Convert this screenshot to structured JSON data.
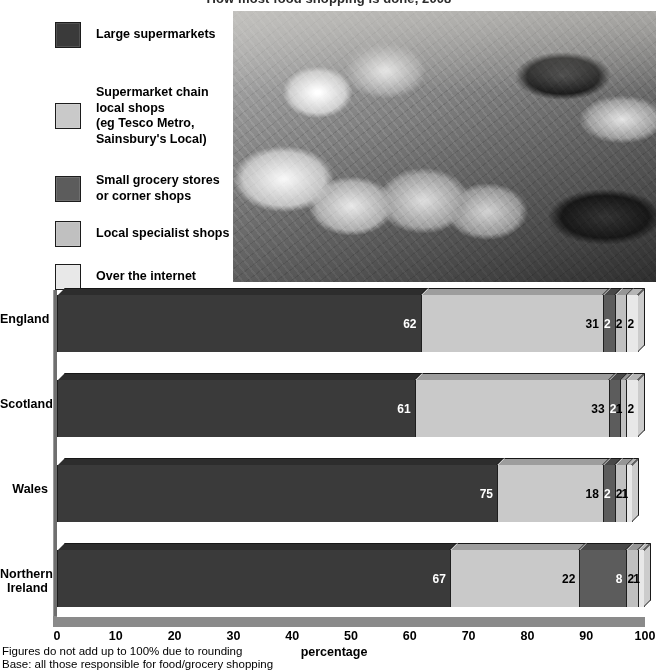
{
  "chart_title": "How most food shopping is done, 2008",
  "legend": {
    "items": [
      {
        "label": "Large supermarkets",
        "color": "#3a3a3a",
        "top": 12
      },
      {
        "label": "Supermarket chain\nlocal shops\n(eg Tesco Metro,\nSainsbury's Local)",
        "color": "#c9c9c9",
        "top": 75
      },
      {
        "label": "Small grocery stores\nor corner shops",
        "color": "#5c5c5c",
        "top": 163
      },
      {
        "label": "Local specialist shops",
        "color": "#c0c0c0",
        "top": 211
      },
      {
        "label": "Over the internet",
        "color": "#e8e8e8",
        "top": 254
      }
    ]
  },
  "photo": {
    "alt": "Packaged fruit and vegetables in plastic wrapping on a supermarket shelf"
  },
  "chart_data": {
    "type": "bar",
    "orientation": "horizontal",
    "stacked": true,
    "title": "How most food shopping is done, 2008",
    "xlabel": "percentage",
    "ylabel": "",
    "xlim": [
      0,
      100
    ],
    "grid": false,
    "legend_position": "top-left",
    "categories": [
      "England",
      "Scotland",
      "Wales",
      "Northern\nIreland"
    ],
    "xticks": [
      0,
      10,
      20,
      30,
      40,
      50,
      60,
      70,
      80,
      90,
      100
    ],
    "series": [
      {
        "name": "Large supermarkets",
        "color": "#3a3a3a",
        "text_color": "#ffffff",
        "values": [
          62,
          61,
          75,
          67
        ]
      },
      {
        "name": "Supermarket chain local shops (eg Tesco Metro, Sainsbury's Local)",
        "color": "#c9c9c9",
        "text_color": "#000000",
        "values": [
          31,
          33,
          18,
          22
        ]
      },
      {
        "name": "Small grocery stores or corner shops",
        "color": "#5c5c5c",
        "text_color": "#ffffff",
        "values": [
          2,
          2,
          2,
          8
        ]
      },
      {
        "name": "Local specialist shops",
        "color": "#c0c0c0",
        "text_color": "#000000",
        "values": [
          2,
          1,
          2,
          2
        ]
      },
      {
        "name": "Over the internet",
        "color": "#e8e8e8",
        "text_color": "#000000",
        "values": [
          2,
          2,
          1,
          1
        ]
      }
    ]
  },
  "footnotes": [
    "Figures do not add up to 100% due to rounding",
    "Base: all those responsible for food/grocery shopping"
  ]
}
